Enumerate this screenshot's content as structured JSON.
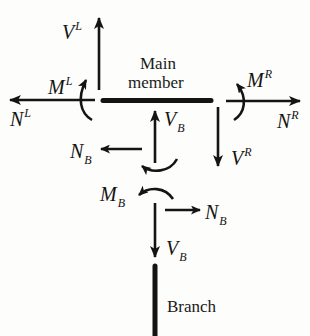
{
  "diagram": {
    "type": "free-body-diagram",
    "main_member_label_line1": "Main",
    "main_member_label_line2": "member",
    "branch_label": "Branch",
    "colors": {
      "ink": "#141414",
      "background": "#fdfdfb"
    },
    "forces": {
      "VL": {
        "symbol": "V",
        "superscript": "L",
        "direction": "up"
      },
      "ML": {
        "symbol": "M",
        "superscript": "L",
        "direction": "counterclockwise"
      },
      "NL": {
        "symbol": "N",
        "superscript": "L",
        "direction": "left"
      },
      "MR": {
        "symbol": "M",
        "superscript": "R",
        "direction": "clockwise"
      },
      "NR": {
        "symbol": "N",
        "superscript": "R",
        "direction": "right"
      },
      "VR": {
        "symbol": "V",
        "superscript": "R",
        "direction": "down"
      },
      "VB_up": {
        "symbol": "V",
        "subscript": "B",
        "direction": "up"
      },
      "NB_left": {
        "symbol": "N",
        "subscript": "B",
        "direction": "left"
      },
      "MB": {
        "symbol": "M",
        "subscript": "B",
        "direction": "counterclockwise"
      },
      "NB_right": {
        "symbol": "N",
        "subscript": "B",
        "direction": "right"
      },
      "VB_down": {
        "symbol": "V",
        "subscript": "B",
        "direction": "down"
      }
    }
  }
}
